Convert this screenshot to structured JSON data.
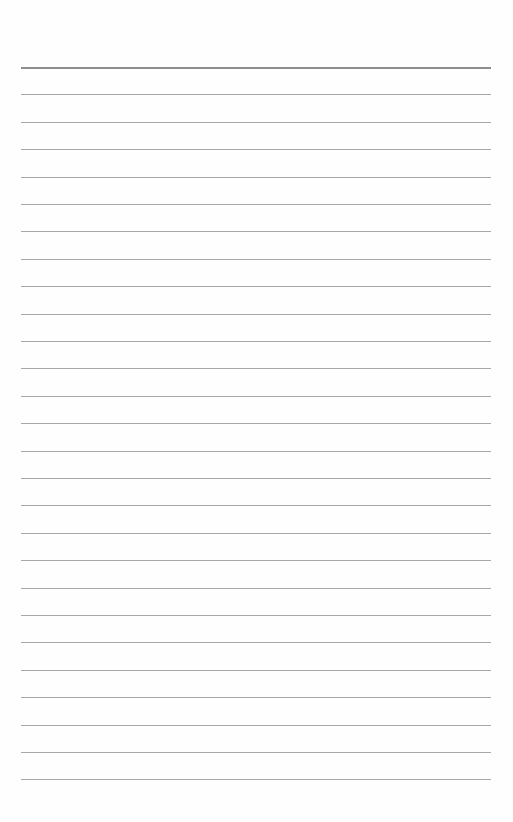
{
  "page": {
    "type": "lined-paper",
    "background_color": "#fefefe",
    "line_color": "#a9a9a9",
    "top_line_color": "#8e8e8e",
    "line_count": 27,
    "first_line_y": 67,
    "line_spacing": 27.4,
    "line_left": 21,
    "line_width": 470
  }
}
